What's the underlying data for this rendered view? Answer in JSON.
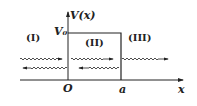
{
  "diagram": {
    "type": "potential-barrier",
    "axis_y_label": "V(x)",
    "axis_x_label": "x",
    "barrier_height_label": "V₀",
    "origin_label": "O",
    "barrier_end_label": "a",
    "regions": [
      {
        "id": "I",
        "label": "(I)"
      },
      {
        "id": "II",
        "label": "(II)"
      },
      {
        "id": "III",
        "label": "(III)"
      }
    ],
    "waves": [
      {
        "region": "I",
        "direction": "right",
        "kind": "incident"
      },
      {
        "region": "I",
        "direction": "left",
        "kind": "reflected"
      },
      {
        "region": "II",
        "direction": "right",
        "kind": "transmitted-in-barrier"
      },
      {
        "region": "II",
        "direction": "left",
        "kind": "reflected-in-barrier"
      },
      {
        "region": "III",
        "direction": "right",
        "kind": "transmitted"
      }
    ]
  }
}
